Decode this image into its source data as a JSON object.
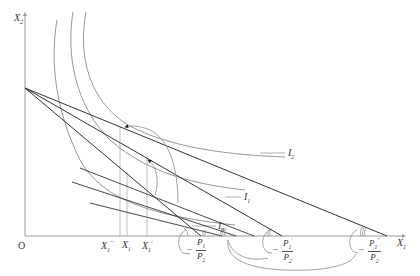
{
  "header": {
    "truncated_caption": ""
  },
  "axes": {
    "y_label": "X",
    "y_sub": "2",
    "x_label": "X",
    "x_sub": "1",
    "origin_label": "O"
  },
  "indifference_curves": [
    {
      "label": "I",
      "sub": "2"
    },
    {
      "label": "I",
      "sub": "1"
    },
    {
      "label": "I",
      "sub": "0"
    }
  ],
  "quantity_labels": [
    {
      "label": "X",
      "sub": "1",
      "prime": "′′"
    },
    {
      "label": "X",
      "sub": "1",
      "prime": ""
    },
    {
      "label": "X",
      "sub": "1",
      "prime": "′"
    }
  ],
  "slope_labels": [
    {
      "neg": "–",
      "num": "P",
      "num_sub": "1",
      "num_prime": "",
      "den": "P",
      "den_sub": "2"
    },
    {
      "neg": "–",
      "num": "P",
      "num_sub": "1",
      "num_prime": "′",
      "den": "P",
      "den_sub": "2"
    },
    {
      "neg": "–",
      "num": "P",
      "num_sub": "1",
      "num_prime": "′′",
      "den": "P",
      "den_sub": "2"
    }
  ],
  "colors": {
    "axis": "#9a9a9a",
    "budget_line": "#333333",
    "curve": "#8a8a8a",
    "guide": "#b0b0b0"
  }
}
